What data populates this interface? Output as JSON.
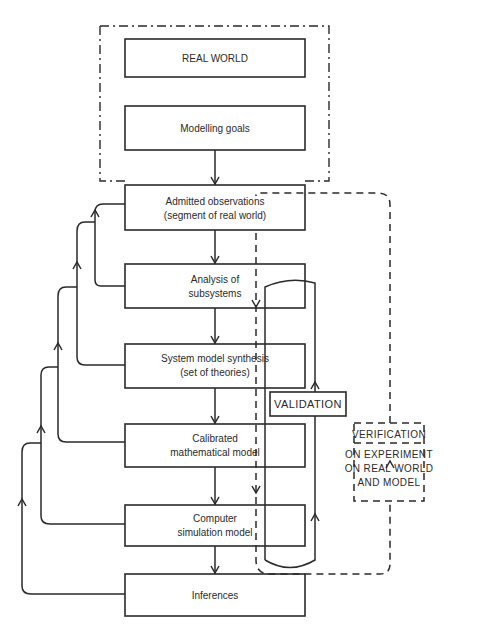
{
  "diagram": {
    "boxes": [
      {
        "id": "real-world",
        "lines": [
          "REAL WORLD"
        ]
      },
      {
        "id": "modelling-goals",
        "lines": [
          "Modelling goals"
        ]
      },
      {
        "id": "admitted-observations",
        "lines": [
          "Admitted observations",
          "(segment of real world)"
        ]
      },
      {
        "id": "analysis-subsystems",
        "lines": [
          "Analysis of",
          "subsystems"
        ]
      },
      {
        "id": "system-model-synthesis",
        "lines": [
          "System model synthesis",
          "(set of theories)"
        ]
      },
      {
        "id": "calibrated-model",
        "lines": [
          "Calibrated",
          "mathematical model"
        ]
      },
      {
        "id": "computer-simulation",
        "lines": [
          "Computer",
          "simulation model"
        ]
      },
      {
        "id": "inferences",
        "lines": [
          "Inferences"
        ]
      }
    ],
    "validation": {
      "label": "VALIDATION"
    },
    "verification": {
      "title": "VERIFICATION",
      "lines": [
        "ON EXPERIMENT",
        "ON REAL WORLD",
        "AND MODEL"
      ]
    }
  }
}
